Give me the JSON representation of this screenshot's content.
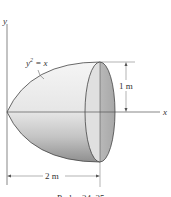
{
  "figure": {
    "axes": {
      "x_label": "x",
      "y_label": "y"
    },
    "curve_label": {
      "base": "y",
      "exponent": "2",
      "rest": " = x"
    },
    "dimensions": {
      "radius": "1 m",
      "length": "2 m"
    },
    "caption": "Probs. 24–25",
    "colors": {
      "line": "#444444",
      "face_fill": "#c8c8c8",
      "body_light": "#f2f2f2",
      "body_dark": "#9a9a9a"
    }
  }
}
